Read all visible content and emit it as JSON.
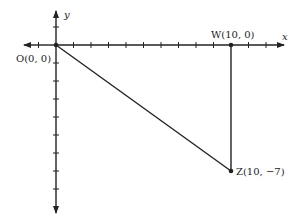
{
  "diagram": {
    "type": "coordinate-plane-right-triangle",
    "axes": {
      "x_label": "x",
      "y_label": "y",
      "x_ticks_visible": [
        -1,
        1,
        2,
        3,
        4,
        5,
        6,
        7,
        8,
        9,
        10,
        11,
        12
      ],
      "y_ticks_visible": [
        1,
        -1,
        -2,
        -3,
        -4,
        -5,
        -6,
        -7,
        -8,
        -9
      ]
    },
    "points": [
      {
        "id": "O",
        "label": "O(0, 0)",
        "x": 0,
        "y": 0
      },
      {
        "id": "W",
        "label": "W(10, 0)",
        "x": 10,
        "y": 0
      },
      {
        "id": "Z",
        "label": "Z(10, −7)",
        "x": 10,
        "y": -7
      }
    ],
    "segments": [
      {
        "from": "O",
        "to": "Z"
      },
      {
        "from": "W",
        "to": "Z"
      }
    ],
    "colors": {
      "ink": "#222222",
      "background": "#ffffff"
    }
  }
}
